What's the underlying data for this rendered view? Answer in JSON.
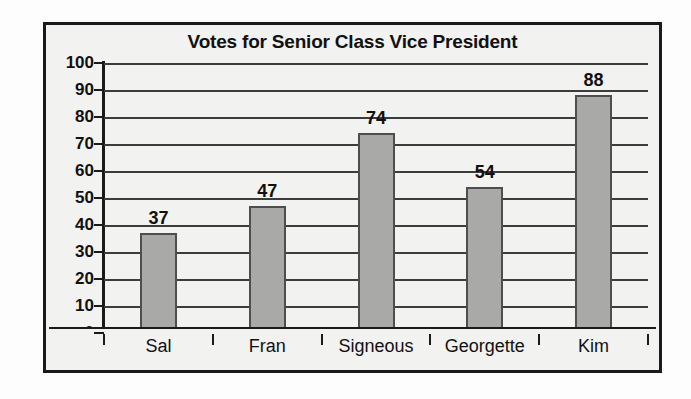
{
  "chart_data": {
    "type": "bar",
    "title": "Votes for Senior Class Vice President",
    "xlabel": "",
    "ylabel": "",
    "categories": [
      "Sal",
      "Fran",
      "Signeous",
      "Georgette",
      "Kim"
    ],
    "values": [
      37,
      47,
      74,
      54,
      88
    ],
    "value_labels": [
      "37",
      "47",
      "74",
      "54",
      "88"
    ],
    "ylim": [
      0,
      100
    ],
    "ytick_step": 10,
    "yticks": [
      "100",
      "90",
      "80",
      "70",
      "60",
      "50",
      "40",
      "30",
      "20",
      "10",
      "0"
    ],
    "grid": true,
    "grid_axis": "y",
    "legend": false,
    "legend_position": "none",
    "colors": {
      "bar_fill": "#a9a9a7",
      "bar_border": "#4e4e4e",
      "gridline": "#3c3c3c",
      "axis": "#1a1a1a",
      "text": "#111111",
      "plot_background": "#f2f2f1",
      "page_background": "#fdfdfd"
    }
  }
}
